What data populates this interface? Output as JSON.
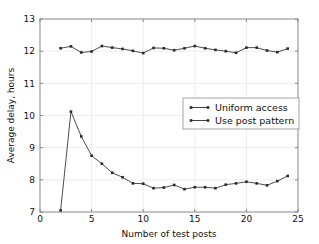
{
  "chart_data": {
    "type": "line",
    "title": "",
    "xlabel": "Number of test posts",
    "ylabel": "Average delay, hours",
    "xlim": [
      0,
      25
    ],
    "ylim": [
      7,
      13
    ],
    "xticks": [
      0,
      5,
      10,
      15,
      20,
      25
    ],
    "yticks": [
      7,
      8,
      9,
      10,
      11,
      12,
      13
    ],
    "xtick_labels": [
      "0",
      "5",
      "10",
      "15",
      "20",
      "25"
    ],
    "ytick_labels": [
      "7",
      "8",
      "9",
      "10",
      "11",
      "12",
      "13"
    ],
    "grid": true,
    "legend_position": "center-right",
    "series": [
      {
        "name": "Uniform access",
        "marker": "square",
        "color": "#2a2a2a",
        "x": [
          2,
          3,
          4,
          5,
          6,
          7,
          8,
          9,
          10,
          11,
          12,
          13,
          14,
          15,
          16,
          17,
          18,
          19,
          20,
          21,
          22,
          23,
          24
        ],
        "values": [
          12.09,
          12.15,
          11.96,
          11.99,
          12.16,
          12.11,
          12.07,
          12.01,
          11.94,
          12.1,
          12.09,
          12.03,
          12.09,
          12.16,
          12.09,
          12.04,
          12.0,
          11.95,
          12.11,
          12.11,
          12.02,
          11.97,
          12.08
        ]
      },
      {
        "name": "Use post pattern",
        "marker": "square",
        "color": "#2a2a2a",
        "x": [
          2,
          3,
          4,
          5,
          6,
          7,
          8,
          9,
          10,
          11,
          12,
          13,
          14,
          15,
          16,
          17,
          18,
          19,
          20,
          21,
          22,
          23,
          24
        ],
        "values": [
          7.05,
          10.12,
          9.35,
          8.75,
          8.5,
          8.22,
          8.08,
          7.89,
          7.88,
          7.74,
          7.76,
          7.84,
          7.71,
          7.77,
          7.77,
          7.74,
          7.85,
          7.89,
          7.94,
          7.89,
          7.83,
          7.96,
          8.12
        ]
      }
    ]
  },
  "legend": {
    "entries": [
      {
        "label": "Uniform access"
      },
      {
        "label": "Use post pattern"
      }
    ]
  },
  "axes": {
    "x_title": "Number of test posts",
    "y_title": "Average delay, hours"
  }
}
